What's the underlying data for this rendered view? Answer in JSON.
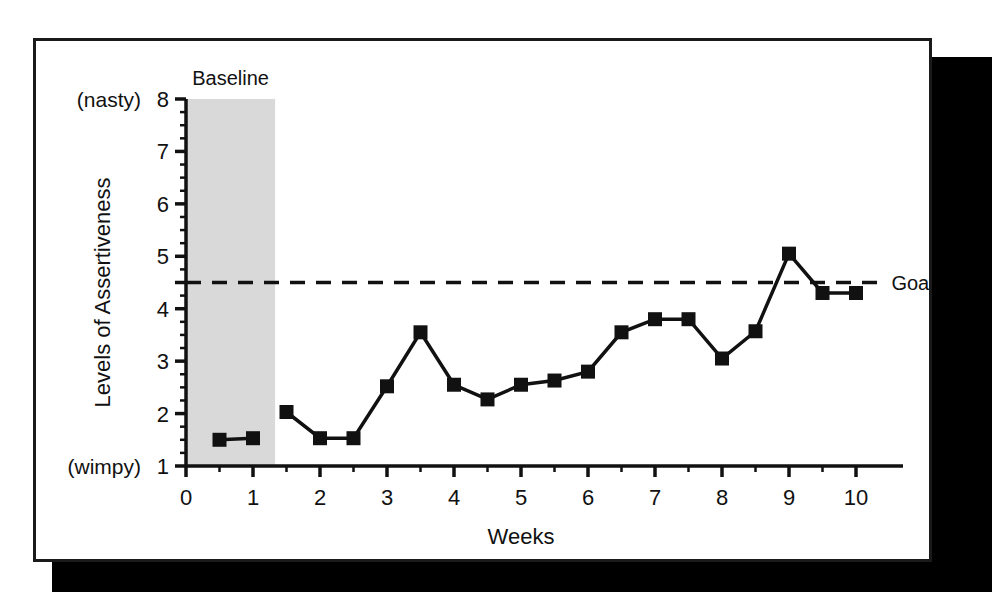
{
  "figure": {
    "frame_color": "#1a1a1a",
    "shadow_color": "#000000",
    "background": "#ffffff"
  },
  "chart_data": {
    "type": "line",
    "title": "",
    "subtitle": "",
    "xlabel": "Weeks",
    "ylabel": "Levels of Assertiveness",
    "xlim": [
      0,
      10.7
    ],
    "ylim": [
      1,
      8
    ],
    "grid": false,
    "legend_position": "none",
    "line_color": "#111111",
    "marker": "square",
    "marker_color": "#111111",
    "x_ticks": [
      0,
      1,
      2,
      3,
      4,
      5,
      6,
      7,
      8,
      9,
      10
    ],
    "x_tick_labels": [
      "0",
      "1",
      "2",
      "3",
      "4",
      "5",
      "6",
      "7",
      "8",
      "9",
      "10"
    ],
    "x_minor_ticks": [
      0.5,
      1.5,
      2.5,
      3.5,
      4.5,
      5.5,
      6.5,
      7.5,
      8.5,
      9.5
    ],
    "y_ticks": [
      1,
      2,
      3,
      4,
      5,
      6,
      7,
      8
    ],
    "y_tick_labels": [
      "1",
      "2",
      "3",
      "4",
      "5",
      "6",
      "7",
      "8"
    ],
    "y_minor_ticks": [
      1.25,
      1.5,
      1.75,
      2.25,
      2.5,
      2.75,
      3.25,
      3.5,
      3.75,
      4.25,
      4.5,
      4.75,
      5.25,
      5.5,
      5.75,
      6.25,
      6.5,
      6.75,
      7.25,
      7.5,
      7.75
    ],
    "y_axis_top_annotation": "(nasty)",
    "y_axis_bottom_annotation": "(wimpy)",
    "phases": [
      {
        "name": "Baseline",
        "label": "Baseline",
        "x_start": 0,
        "x_end": 1.33,
        "shade_color": "#d9d9d9"
      },
      {
        "name": "Intervention",
        "label": "",
        "x_start": 1.33,
        "x_end": 10.7,
        "shade_color": "#ffffff"
      }
    ],
    "goal_line": {
      "label": "Goal",
      "value": 4.5,
      "style": "dashed",
      "color": "#111111",
      "x_start": 0,
      "x_end": 10.35
    },
    "series": [
      {
        "name": "Baseline",
        "phase": "Baseline",
        "x": [
          0.5,
          1.0
        ],
        "values": [
          1.5,
          1.53
        ]
      },
      {
        "name": "Intervention",
        "phase": "Intervention",
        "x": [
          1.5,
          2.0,
          2.5,
          3.0,
          3.5,
          4.0,
          4.5,
          5.0,
          5.5,
          6.0,
          6.5,
          7.0,
          7.5,
          8.0,
          8.5,
          9.0,
          9.5,
          10.0
        ],
        "values": [
          2.03,
          1.53,
          1.53,
          2.52,
          3.55,
          2.55,
          2.27,
          2.55,
          2.63,
          2.8,
          3.55,
          3.8,
          3.8,
          3.05,
          3.57,
          5.05,
          4.3,
          4.3
        ]
      }
    ]
  }
}
